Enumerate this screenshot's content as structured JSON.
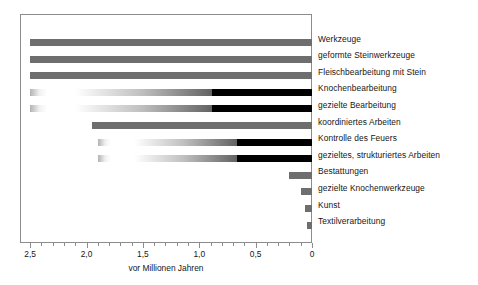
{
  "chart_data": {
    "type": "bar",
    "orientation": "horizontal",
    "title": "",
    "subtitle": "",
    "xlabel": "vor Millionen Jahren",
    "ylabel": "",
    "xlim": [
      2.59,
      0
    ],
    "x_axis_reversed": true,
    "grid": false,
    "legend": null,
    "tick_labels": [
      "2,5",
      "2,0",
      "1,5",
      "1,0",
      "0,5",
      "0"
    ],
    "tick_values": [
      2.5,
      2.0,
      1.5,
      1.0,
      0.5,
      0.0
    ],
    "minor_tick_step": 0.1,
    "categories": [
      "Werkzeuge",
      "geformte Steinwerkzeuge",
      "Fleischbearbeitung mit Stein",
      "Knochenbearbeitung",
      "gezielte Bearbeitung",
      "koordiniertes Arbeiten",
      "Kontrolle des Feuers",
      "gezieltes, strukturiertes Arbeiten",
      "Bestattungen",
      "gezielte Knochenwerkzeuge",
      "Kunst",
      "Textilverarbeitung"
    ],
    "bars": [
      {
        "category": "Werkzeuge",
        "start_mya": 2.5,
        "end_mya": 0.0,
        "style": "solid",
        "color": "#6e6e6e"
      },
      {
        "category": "geformte Steinwerkzeuge",
        "start_mya": 2.5,
        "end_mya": 0.0,
        "style": "solid",
        "color": "#6e6e6e"
      },
      {
        "category": "Fleischbearbeitung mit Stein",
        "start_mya": 2.5,
        "end_mya": 0.0,
        "style": "solid",
        "color": "#6e6e6e"
      },
      {
        "category": "Knochenbearbeitung",
        "start_mya": 2.5,
        "end_mya": 0.0,
        "style": "gradient-with-fragment",
        "fragment_start_mya": 2.5,
        "fragment_end_mya": 2.35,
        "gradient_start_mya": 2.1,
        "solid_from_mya": 1.6,
        "color": "#000000"
      },
      {
        "category": "gezielte Bearbeitung",
        "start_mya": 2.5,
        "end_mya": 0.0,
        "style": "gradient-with-fragment",
        "fragment_start_mya": 2.5,
        "fragment_end_mya": 2.35,
        "gradient_start_mya": 2.1,
        "solid_from_mya": 1.6,
        "color": "#000000"
      },
      {
        "category": "koordiniertes Arbeiten",
        "start_mya": 1.95,
        "end_mya": 0.0,
        "style": "solid",
        "color": "#6e6e6e"
      },
      {
        "category": "Kontrolle des Feuers",
        "start_mya": 1.9,
        "end_mya": 0.0,
        "style": "gradient-with-fragment",
        "fragment_start_mya": 1.9,
        "fragment_end_mya": 1.78,
        "gradient_start_mya": 1.58,
        "solid_from_mya": 1.3,
        "color": "#000000"
      },
      {
        "category": "gezieltes, strukturiertes Arbeiten",
        "start_mya": 1.9,
        "end_mya": 0.0,
        "style": "gradient-with-fragment",
        "fragment_start_mya": 1.9,
        "fragment_end_mya": 1.78,
        "gradient_start_mya": 1.58,
        "solid_from_mya": 1.1,
        "color": "#000000"
      },
      {
        "category": "Bestattungen",
        "start_mya": 0.2,
        "end_mya": 0.0,
        "style": "solid",
        "color": "#6e6e6e"
      },
      {
        "category": "gezielte Knochenwerkzeuge",
        "start_mya": 0.1,
        "end_mya": 0.0,
        "style": "solid",
        "color": "#6e6e6e"
      },
      {
        "category": "Kunst",
        "start_mya": 0.06,
        "end_mya": 0.0,
        "style": "solid",
        "color": "#6e6e6e"
      },
      {
        "category": "Textilverarbeitung",
        "start_mya": 0.04,
        "end_mya": 0.0,
        "style": "solid",
        "color": "#6e6e6e"
      }
    ]
  },
  "colors": {
    "bar_gray": "#6e6e6e",
    "bar_black": "#000000",
    "frame": "#8c8c8c",
    "text": "#161616",
    "background": "#ffffff"
  }
}
